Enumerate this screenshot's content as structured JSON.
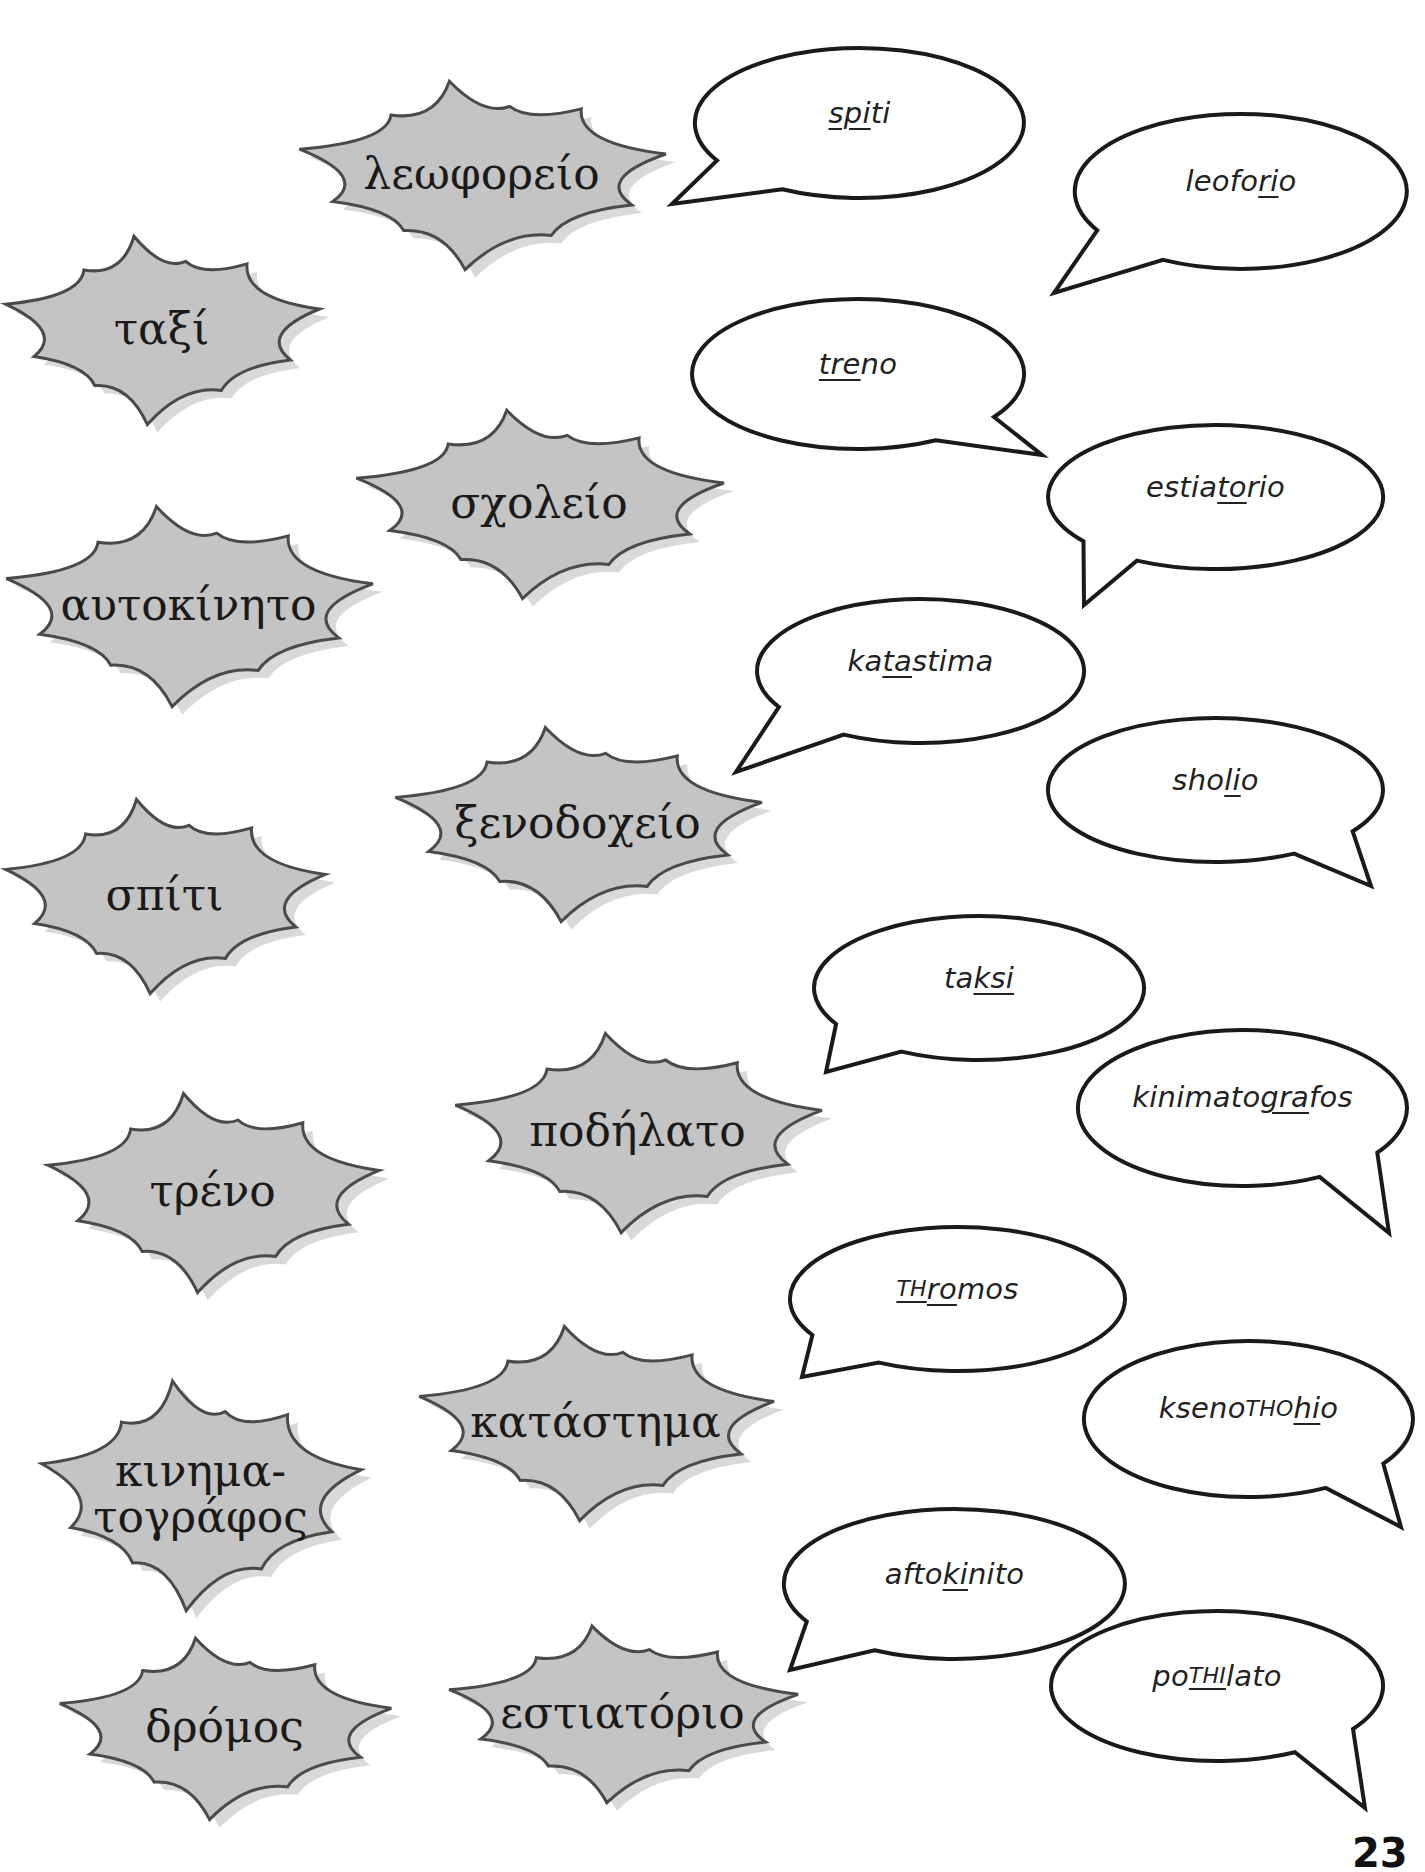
{
  "page": {
    "number": "23",
    "background": "#ffffff",
    "colors": {
      "burst_fill": "#c4c4c4",
      "burst_shadow": "#d9d9d9",
      "burst_stroke": "#4a4a4a",
      "bubble_fill": "#ffffff",
      "bubble_stroke": "#1a1a1a"
    }
  },
  "greek_words": [
    {
      "id": "leoforeio",
      "text": "λεωφορείο",
      "x": 293,
      "y": 78,
      "w": 377,
      "h": 192
    },
    {
      "id": "taxi",
      "text": "ταξί",
      "x": 0,
      "y": 233,
      "w": 323,
      "h": 192
    },
    {
      "id": "scholeio",
      "text": "σχολείο",
      "x": 350,
      "y": 407,
      "w": 378,
      "h": 192
    },
    {
      "id": "aftokinito",
      "text": "αυτοκίνητο",
      "x": 0,
      "y": 503,
      "w": 377,
      "h": 204
    },
    {
      "id": "xenodocheio",
      "text": "ξενοδοχείο",
      "x": 389,
      "y": 724,
      "w": 377,
      "h": 198
    },
    {
      "id": "spiti",
      "text": "σπίτι",
      "x": 0,
      "y": 796,
      "w": 329,
      "h": 198
    },
    {
      "id": "podilato",
      "text": "ποδήλατο",
      "x": 449,
      "y": 1030,
      "w": 377,
      "h": 203
    },
    {
      "id": "treno",
      "text": "τρένο",
      "x": 42,
      "y": 1090,
      "w": 341,
      "h": 203
    },
    {
      "id": "katastima",
      "text": "κατάστημα",
      "x": 413,
      "y": 1323,
      "w": 365,
      "h": 198
    },
    {
      "id": "kinimatografos",
      "text": "κινημα-\nτογράφος",
      "x": 36,
      "y": 1377,
      "w": 329,
      "h": 234
    },
    {
      "id": "dromos",
      "text": "δρόμος",
      "x": 54,
      "y": 1635,
      "w": 341,
      "h": 185
    },
    {
      "id": "estiatorio",
      "text": "εστιατόριο",
      "x": 443,
      "y": 1623,
      "w": 359,
      "h": 180
    }
  ],
  "transliterations": [
    {
      "id": "spiti",
      "x": 695,
      "y": 48,
      "w": 329,
      "h": 150,
      "tail": "left",
      "tx": 672,
      "ty": 204,
      "segments": [
        {
          "t": "spi",
          "u": true
        },
        {
          "t": "ti"
        }
      ]
    },
    {
      "id": "leoforio",
      "x": 1075,
      "y": 114,
      "w": 332,
      "h": 155,
      "tail": "left",
      "tx": 1054,
      "ty": 293,
      "segments": [
        {
          "t": "leofo"
        },
        {
          "t": "ri",
          "u": true
        },
        {
          "t": "o"
        }
      ]
    },
    {
      "id": "treno",
      "x": 692,
      "y": 299,
      "w": 332,
      "h": 150,
      "tail": "right",
      "tx": 1042,
      "ty": 455,
      "segments": [
        {
          "t": "tre",
          "u": true
        },
        {
          "t": "no"
        }
      ]
    },
    {
      "id": "estiatorio",
      "x": 1048,
      "y": 425,
      "w": 335,
      "h": 144,
      "tail": "left-down",
      "tx": 1084,
      "ty": 605,
      "segments": [
        {
          "t": "estia"
        },
        {
          "t": "to",
          "u": true
        },
        {
          "t": "rio"
        }
      ]
    },
    {
      "id": "katastima",
      "x": 757,
      "y": 599,
      "w": 327,
      "h": 144,
      "tail": "left",
      "tx": 736,
      "ty": 772,
      "segments": [
        {
          "t": "ka"
        },
        {
          "t": "ta",
          "u": true
        },
        {
          "t": "stima"
        }
      ]
    },
    {
      "id": "sholio",
      "x": 1048,
      "y": 718,
      "w": 335,
      "h": 144,
      "tail": "right",
      "tx": 1371,
      "ty": 886,
      "segments": [
        {
          "t": "sho"
        },
        {
          "t": "li",
          "u": true
        },
        {
          "t": "o"
        }
      ]
    },
    {
      "id": "taksi",
      "x": 814,
      "y": 916,
      "w": 330,
      "h": 144,
      "tail": "left",
      "tx": 826,
      "ty": 1072,
      "segments": [
        {
          "t": "ta"
        },
        {
          "t": "ksi",
          "u": true
        }
      ]
    },
    {
      "id": "kinimatografos",
      "x": 1078,
      "y": 1030,
      "w": 329,
      "h": 156,
      "tail": "right",
      "tx": 1389,
      "ty": 1233,
      "segments": [
        {
          "t": "kinimato"
        },
        {
          "t": "gra",
          "u": true
        },
        {
          "t": "fos"
        }
      ]
    },
    {
      "id": "thromos",
      "x": 790,
      "y": 1227,
      "w": 335,
      "h": 144,
      "tail": "left",
      "tx": 802,
      "ty": 1377,
      "segments": [
        {
          "t": "TH",
          "u": true,
          "sc": true
        },
        {
          "t": "ro",
          "u": true
        },
        {
          "t": "mos"
        }
      ]
    },
    {
      "id": "ksenothohio",
      "x": 1084,
      "y": 1341,
      "w": 329,
      "h": 156,
      "tail": "right",
      "tx": 1401,
      "ty": 1527,
      "segments": [
        {
          "t": "kseno"
        },
        {
          "t": "THO",
          "sc": true
        },
        {
          "t": "hi",
          "u": true
        },
        {
          "t": "o"
        }
      ]
    },
    {
      "id": "aftokinito",
      "x": 784,
      "y": 1509,
      "w": 341,
      "h": 150,
      "tail": "left",
      "tx": 790,
      "ty": 1670,
      "segments": [
        {
          "t": "afto"
        },
        {
          "t": "ki",
          "u": true
        },
        {
          "t": "nito"
        }
      ]
    },
    {
      "id": "pothilato",
      "x": 1051,
      "y": 1611,
      "w": 332,
      "h": 150,
      "tail": "right",
      "tx": 1365,
      "ty": 1808,
      "segments": [
        {
          "t": "po"
        },
        {
          "t": "THI",
          "u": true,
          "sc": true
        },
        {
          "t": "lato"
        }
      ]
    }
  ]
}
